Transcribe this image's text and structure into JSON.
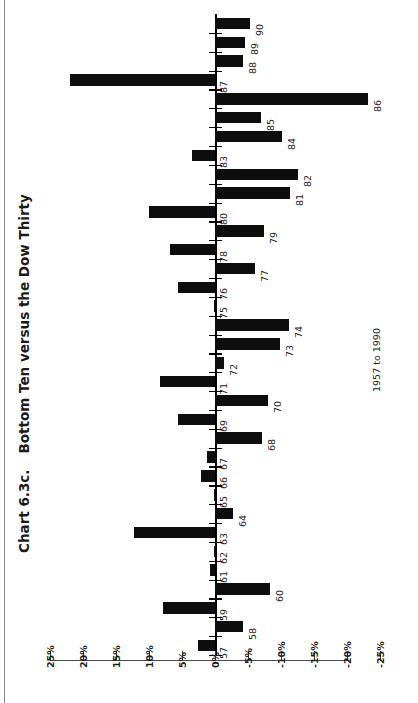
{
  "title": {
    "number": "Chart 6.3c.",
    "text": "Bottom Ten versus the Dow Thirty",
    "full": "Chart 6.3c.    Bottom Ten versus the Dow Thirty"
  },
  "range_label": "1957 to 1990",
  "chart_data": {
    "type": "bar",
    "orientation": "horizontal-rotated",
    "subtitle": "1957 to 1990",
    "xlabel": "",
    "ylabel": "",
    "axis_labels": [
      "25%",
      "20%",
      "15%",
      "10%",
      "5%",
      "0%",
      "-5%",
      "-10%",
      "-15%",
      "-20%",
      "-25%"
    ],
    "axis_values": [
      25,
      20,
      15,
      10,
      5,
      0,
      -5,
      -10,
      -15,
      -20,
      -25
    ],
    "ylim": [
      25,
      -25
    ],
    "grid": false,
    "legend": null,
    "categories": [
      "57",
      "58",
      "59",
      "60",
      "61",
      "62",
      "63",
      "64",
      "65",
      "66",
      "67",
      "68",
      "69",
      "70",
      "71",
      "72",
      "73",
      "74",
      "75",
      "76",
      "77",
      "78",
      "79",
      "80",
      "81",
      "82",
      "83",
      "84",
      "85",
      "86",
      "87",
      "88",
      "89",
      "90"
    ],
    "values": [
      2.6,
      -4.2,
      7.9,
      -8.3,
      0.8,
      0.1,
      12.3,
      -2.7,
      0.2,
      2.1,
      1.2,
      -7.1,
      5.6,
      -8.0,
      8.3,
      -1.4,
      -9.9,
      -11.2,
      0.1,
      5.6,
      -6.0,
      6.8,
      -7.4,
      10.0,
      -11.4,
      -12.6,
      3.5,
      -10.2,
      -7.0,
      -23.2,
      22.0,
      -4.2,
      -4.5,
      -5.3
    ],
    "series": [
      {
        "name": "Bottom Ten versus the Dow Thirty",
        "values": [
          2.6,
          -4.2,
          7.9,
          -8.3,
          0.8,
          0.1,
          12.3,
          -2.7,
          0.2,
          2.1,
          1.2,
          -7.1,
          5.6,
          -8.0,
          8.3,
          -1.4,
          -9.9,
          -11.2,
          0.1,
          5.6,
          -6.0,
          6.8,
          -7.4,
          10.0,
          -11.4,
          -12.6,
          3.5,
          -10.2,
          -7.0,
          -23.2,
          22.0,
          -4.2,
          -4.5,
          -5.3
        ]
      }
    ]
  }
}
